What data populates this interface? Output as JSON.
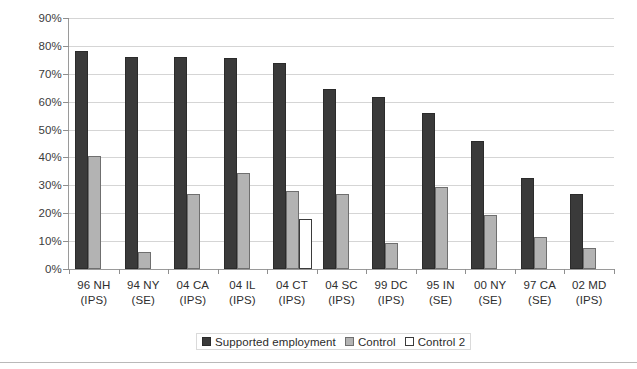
{
  "chart_data": {
    "type": "bar",
    "title": "",
    "subtitle": "",
    "xlabel": "",
    "ylabel": "",
    "ylim": [
      0,
      90
    ],
    "y_tick_labels": [
      "0%",
      "10%",
      "20%",
      "30%",
      "40%",
      "50%",
      "60%",
      "70%",
      "80%",
      "90%"
    ],
    "y_tick_values": [
      0,
      10,
      20,
      30,
      40,
      50,
      60,
      70,
      80,
      90
    ],
    "grid": true,
    "legend_position": "bottom-center",
    "value_unit": "percent",
    "categories": [
      "96 NH (IPS)",
      "94 NY (SE)",
      "04 CA (IPS)",
      "04 IL (IPS)",
      "04 CT (IPS)",
      "04 SC (IPS)",
      "99 DC (IPS)",
      "95 IN (SE)",
      "00 NY (SE)",
      "97 CA (SE)",
      "02 MD (IPS)"
    ],
    "category_lines": [
      [
        "96 NH",
        "(IPS)"
      ],
      [
        "94 NY",
        "(SE)"
      ],
      [
        "04 CA",
        "(IPS)"
      ],
      [
        "04 IL",
        "(IPS)"
      ],
      [
        "04 CT",
        "(IPS)"
      ],
      [
        "04 SC",
        "(IPS)"
      ],
      [
        "99 DC",
        "(IPS)"
      ],
      [
        "95 IN",
        "(SE)"
      ],
      [
        "00 NY",
        "(SE)"
      ],
      [
        "97 CA",
        "(SE)"
      ],
      [
        "02 MD",
        "(IPS)"
      ]
    ],
    "series": [
      {
        "name": "Supported employment",
        "color": "#3a3a3a",
        "values": [
          78,
          76,
          76,
          75.5,
          74,
          64.5,
          61.5,
          56,
          46,
          32.5,
          27
        ]
      },
      {
        "name": "Control",
        "color": "#b3b3b3",
        "values": [
          40.5,
          6,
          27,
          34.5,
          28,
          27,
          9.5,
          29.5,
          19.5,
          11.5,
          7.5
        ]
      },
      {
        "name": "Control 2",
        "color": "#ffffff",
        "values": [
          null,
          null,
          null,
          null,
          18,
          null,
          null,
          null,
          null,
          null,
          null
        ]
      }
    ]
  },
  "legend": {
    "items": [
      {
        "label": "Supported employment",
        "swatch": "dark-swatch"
      },
      {
        "label": "Control",
        "swatch": "gray-swatch"
      },
      {
        "label": "Control 2",
        "swatch": "white-swatch"
      }
    ]
  }
}
